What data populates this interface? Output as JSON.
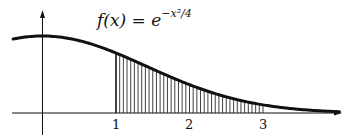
{
  "chart_data": {
    "type": "area",
    "function": "exp(-x^2/4)",
    "shaded_region": {
      "from": 1,
      "to": 3,
      "style": "vertical hatching"
    },
    "x_ticks": [
      "1",
      "2",
      "3"
    ],
    "x_range": [
      -0.4,
      4.1
    ],
    "y_range": [
      0,
      1.2
    ],
    "grid": false,
    "xlabel": "",
    "ylabel": ""
  },
  "label": {
    "lhs": "f(x) = e",
    "exponent": "−x²/4"
  },
  "ticks": [
    "1",
    "2",
    "3"
  ],
  "colors": {
    "ink": "#111111",
    "background": "#ffffff"
  }
}
